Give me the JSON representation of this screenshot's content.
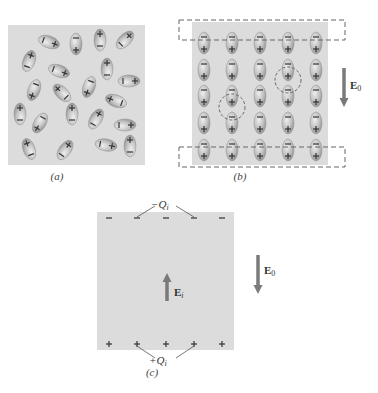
{
  "colors": {
    "background": "#ffffff",
    "dielectric": "#dcdcdc",
    "molecule_fill": "#c4c4c4",
    "molecule_edge": "#9a9a9a",
    "sign": "#333333",
    "dash": "#666666",
    "arrow": "#7a7a7a"
  },
  "panels": [
    {
      "id": "a",
      "caption": "(a)",
      "box": {
        "x": 8,
        "y": 25,
        "w": 137,
        "h": 140
      },
      "caption_pos": {
        "x": 57,
        "y": 178
      },
      "description": "Randomly oriented polar molecules, no external field",
      "molecules": [
        {
          "x": 49,
          "y": 42,
          "angle": -70
        },
        {
          "x": 76,
          "y": 44,
          "angle": 0
        },
        {
          "x": 100,
          "y": 40,
          "angle": 180
        },
        {
          "x": 125,
          "y": 40,
          "angle": -135
        },
        {
          "x": 29,
          "y": 61,
          "angle": -160
        },
        {
          "x": 59,
          "y": 71,
          "angle": -70
        },
        {
          "x": 107,
          "y": 69,
          "angle": 180
        },
        {
          "x": 129,
          "y": 81,
          "angle": -90
        },
        {
          "x": 34,
          "y": 90,
          "angle": 20
        },
        {
          "x": 62,
          "y": 93,
          "angle": 135
        },
        {
          "x": 89,
          "y": 87,
          "angle": 20
        },
        {
          "x": 116,
          "y": 101,
          "angle": 110
        },
        {
          "x": 20,
          "y": 114,
          "angle": 180
        },
        {
          "x": 72,
          "y": 114,
          "angle": 180
        },
        {
          "x": 40,
          "y": 123,
          "angle": 30
        },
        {
          "x": 96,
          "y": 119,
          "angle": -150
        },
        {
          "x": 125,
          "y": 125,
          "angle": -90
        },
        {
          "x": 29,
          "y": 149,
          "angle": 160
        },
        {
          "x": 65,
          "y": 150,
          "angle": -145
        },
        {
          "x": 106,
          "y": 145,
          "angle": -80
        },
        {
          "x": 130,
          "y": 146,
          "angle": 180
        }
      ]
    },
    {
      "id": "b",
      "caption": "(b)",
      "box": {
        "x": 192,
        "y": 22,
        "w": 136,
        "h": 143
      },
      "caption_pos": {
        "x": 240,
        "y": 178
      },
      "description": "Molecules aligned by external field E0",
      "grid": {
        "cols": [
          204,
          232,
          260,
          288,
          316
        ],
        "rows": [
          43,
          70,
          96,
          123,
          150
        ]
      },
      "dashed_rects": [
        {
          "x": 179,
          "y": 20,
          "w": 166,
          "h": 20
        },
        {
          "x": 179,
          "y": 147,
          "w": 166,
          "h": 20
        }
      ],
      "dashed_circles": [
        {
          "cx": 232,
          "cy": 107,
          "r": 13
        },
        {
          "cx": 288,
          "cy": 80,
          "r": 13
        }
      ],
      "field": {
        "label": "E",
        "subscript": "0",
        "x1": 344,
        "y1": 68,
        "x2": 344,
        "y2": 107,
        "label_x": 350,
        "label_y": 79
      }
    },
    {
      "id": "c",
      "caption": "(c)",
      "box": {
        "x": 97,
        "y": 212,
        "w": 137,
        "h": 138
      },
      "caption_pos": {
        "x": 152,
        "y": 374
      },
      "description": "Net induced surface charges and induced field Ei",
      "top_sign": "−",
      "bottom_sign": "+",
      "sign_xs": [
        109,
        137,
        166,
        194,
        222
      ],
      "top_sign_y": 218,
      "bottom_sign_y": 344,
      "top_charge": {
        "label": "−Q",
        "subscript": "i",
        "x": 151,
        "y": 198,
        "lines": [
          [
            137,
            217,
            155,
            206
          ],
          [
            194,
            217,
            176,
            206
          ]
        ]
      },
      "bottom_charge": {
        "label": "+Q",
        "subscript": "i",
        "x": 149,
        "y": 354,
        "lines": [
          [
            137,
            346,
            155,
            358
          ],
          [
            194,
            346,
            176,
            358
          ]
        ]
      },
      "induced_field": {
        "label": "E",
        "subscript": "i",
        "x1": 167,
        "y1": 301,
        "x2": 167,
        "y2": 273,
        "label_x": 174,
        "label_y": 286
      },
      "external_field": {
        "label": "E",
        "subscript": "0",
        "x1": 258,
        "y1": 255,
        "x2": 258,
        "y2": 294,
        "label_x": 264,
        "label_y": 264
      }
    }
  ]
}
